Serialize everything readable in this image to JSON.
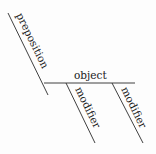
{
  "diagram": {
    "type": "sentence-diagram-prepositional-phrase",
    "labels": {
      "preposition": "preposition",
      "object": "object",
      "modifier_1": "modifier",
      "modifier_2": "modifier"
    },
    "line_color": "#2a2a2a",
    "text_color": "#1a1a1a"
  }
}
